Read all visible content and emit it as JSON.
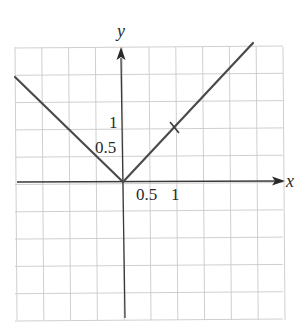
{
  "chart_data": {
    "type": "line",
    "title": "",
    "xlabel": "x",
    "ylabel": "y",
    "function": "y = |x|",
    "xlim": [
      -2,
      3
    ],
    "ylim": [
      -2.5,
      2.5
    ],
    "grid": true,
    "grid_step": 0.5,
    "x_tick_labels": [
      "0.5",
      "1"
    ],
    "y_tick_labels": [
      "0.5",
      "1"
    ],
    "series": [
      {
        "name": "y = |x|",
        "x": [
          -2,
          0,
          2.4
        ],
        "y": [
          2,
          0,
          2.4
        ]
      }
    ],
    "annotations": [
      {
        "type": "tick-mark",
        "x": 1,
        "y": 1
      }
    ],
    "colors": {
      "curve": "#4a4a4a",
      "axis": "#3a3a3a",
      "grid": "#c9c9c9"
    }
  },
  "labels": {
    "x_axis": "x",
    "y_axis": "y",
    "x_tick_half": "0.5",
    "x_tick_one": "1",
    "y_tick_half": "0.5",
    "y_tick_one": "1"
  }
}
